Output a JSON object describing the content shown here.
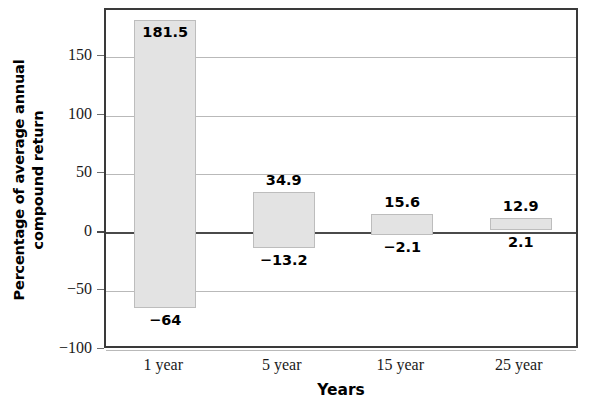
{
  "chart_data": {
    "type": "bar",
    "title": "",
    "subtitle": "",
    "xlabel": "Years",
    "ylabel": "Percentage of average annual compound return",
    "ylabel_lines": [
      "Percentage of average annual",
      "compound return"
    ],
    "categories": [
      "1 year",
      "5 year",
      "15 year",
      "25 year"
    ],
    "series": [
      {
        "name": "Maximum",
        "values": [
          181.5,
          34.9,
          15.6,
          12.9
        ],
        "value_labels": [
          "181.5",
          "34.9",
          "15.6",
          "12.9"
        ]
      },
      {
        "name": "Minimum",
        "values": [
          -64,
          -13.2,
          -2.1,
          2.1
        ],
        "value_labels": [
          "−64",
          "−13.2",
          "−2.1",
          "2.1"
        ]
      }
    ],
    "bars": [
      {
        "category": "1 year",
        "high": 181.5,
        "low": -64,
        "high_label": "181.5",
        "low_label": "−64",
        "high_label_inside": true
      },
      {
        "category": "5 year",
        "high": 34.9,
        "low": -13.2,
        "high_label": "34.9",
        "low_label": "−13.2",
        "high_label_inside": false
      },
      {
        "category": "15 year",
        "high": 15.6,
        "low": -2.1,
        "high_label": "15.6",
        "low_label": "−2.1",
        "high_label_inside": false
      },
      {
        "category": "25 year",
        "high": 12.9,
        "low": 2.1,
        "high_label": "12.9",
        "low_label": "2.1",
        "high_label_inside": false
      }
    ],
    "yticks": [
      150,
      100,
      50,
      0,
      -50,
      -100
    ],
    "ytick_labels": [
      "150",
      "100",
      "50",
      "0",
      "−50",
      "−100"
    ],
    "ylim": [
      -100,
      190
    ],
    "grid": true,
    "legend": false,
    "colors": {
      "bar_fill": "#e3e3e3",
      "bar_border": "#bdbdbd",
      "gridline": "#b9b9b9",
      "zero_line": "#4a4a4a",
      "frame": "#3a3a3a",
      "text": "#000000"
    }
  }
}
